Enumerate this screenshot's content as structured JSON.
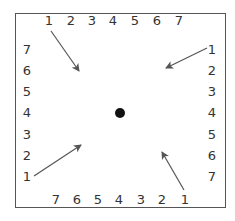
{
  "diagram": {
    "frame": {
      "x": 15,
      "y": 13,
      "width": 211,
      "height": 195,
      "color": "#555555"
    },
    "center_dot": {
      "cx": 120,
      "cy": 113,
      "r": 5,
      "color": "#111111"
    },
    "label_color": "#333333",
    "arrow_color": "#555555",
    "top_labels": [
      {
        "text": "1",
        "x": 49,
        "y": 21
      },
      {
        "text": "2",
        "x": 71,
        "y": 21
      },
      {
        "text": "3",
        "x": 92,
        "y": 21
      },
      {
        "text": "4",
        "x": 113,
        "y": 21
      },
      {
        "text": "5",
        "x": 135,
        "y": 21
      },
      {
        "text": "6",
        "x": 157,
        "y": 21
      },
      {
        "text": "7",
        "x": 179,
        "y": 21
      }
    ],
    "right_labels": [
      {
        "text": "1",
        "x": 212,
        "y": 50
      },
      {
        "text": "2",
        "x": 212,
        "y": 71
      },
      {
        "text": "3",
        "x": 212,
        "y": 92
      },
      {
        "text": "4",
        "x": 212,
        "y": 113
      },
      {
        "text": "5",
        "x": 212,
        "y": 135
      },
      {
        "text": "6",
        "x": 212,
        "y": 156
      },
      {
        "text": "7",
        "x": 212,
        "y": 177
      }
    ],
    "bottom_labels": [
      {
        "text": "7",
        "x": 56,
        "y": 200
      },
      {
        "text": "6",
        "x": 77,
        "y": 200
      },
      {
        "text": "5",
        "x": 98,
        "y": 200
      },
      {
        "text": "4",
        "x": 119,
        "y": 200
      },
      {
        "text": "3",
        "x": 141,
        "y": 200
      },
      {
        "text": "2",
        "x": 162,
        "y": 200
      },
      {
        "text": "1",
        "x": 185,
        "y": 200
      }
    ],
    "left_labels": [
      {
        "text": "7",
        "x": 27,
        "y": 50
      },
      {
        "text": "6",
        "x": 27,
        "y": 71
      },
      {
        "text": "5",
        "x": 27,
        "y": 92
      },
      {
        "text": "4",
        "x": 27,
        "y": 113
      },
      {
        "text": "3",
        "x": 27,
        "y": 135
      },
      {
        "text": "2",
        "x": 27,
        "y": 156
      },
      {
        "text": "1",
        "x": 27,
        "y": 177
      }
    ],
    "arrows": [
      {
        "name": "arrow-top-left",
        "x1": 51,
        "y1": 31,
        "x2": 79,
        "y2": 71
      },
      {
        "name": "arrow-top-right",
        "x1": 207,
        "y1": 48,
        "x2": 166,
        "y2": 68
      },
      {
        "name": "arrow-bottom-left",
        "x1": 34,
        "y1": 176,
        "x2": 81,
        "y2": 145
      },
      {
        "name": "arrow-bottom-right",
        "x1": 184,
        "y1": 190,
        "x2": 162,
        "y2": 152
      }
    ]
  }
}
